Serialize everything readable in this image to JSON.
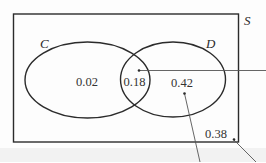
{
  "diagram": {
    "type": "venn",
    "universe_label": "S",
    "sets": [
      {
        "label": "C",
        "only_value": "0.02"
      },
      {
        "label": "D",
        "only_value": "0.42"
      }
    ],
    "intersection_value": "0.18",
    "outside_value": "0.38",
    "colors": {
      "stroke": "#2b2b2b",
      "text": "#333333",
      "background": "#fdfdfd",
      "bottom_strip": "#f2f2f2"
    }
  }
}
